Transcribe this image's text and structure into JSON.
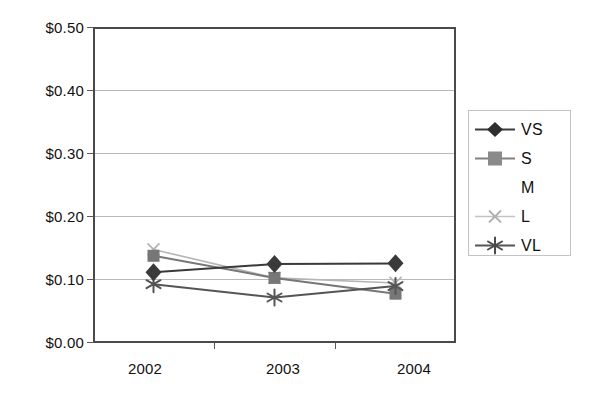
{
  "chart_data": {
    "type": "line",
    "title": "",
    "xlabel": "",
    "ylabel": "",
    "categories": [
      "2002",
      "2003",
      "2004"
    ],
    "ylim": [
      0.0,
      0.5
    ],
    "ytick_values": [
      0.5,
      0.4,
      0.3,
      0.2,
      0.1,
      0.0
    ],
    "ytick_labels": [
      "$0.50",
      "$0.40",
      "$0.30",
      "$0.20",
      "$0.10",
      "$0.00"
    ],
    "grid": true,
    "legend_position": "right",
    "series": [
      {
        "name": "VS",
        "marker": "diamond",
        "color": "#3a3a3a",
        "values": [
          0.112,
          0.125,
          0.126
        ]
      },
      {
        "name": "S",
        "marker": "square",
        "color": "#777777",
        "values": [
          0.138,
          0.103,
          0.078
        ]
      },
      {
        "name": "M",
        "marker": "none",
        "color": "#ffffff",
        "values": [
          null,
          null,
          null
        ]
      },
      {
        "name": "L",
        "marker": "x",
        "color": "#b5b5b5",
        "values": [
          0.148,
          0.103,
          0.095
        ]
      },
      {
        "name": "VL",
        "marker": "asterisk",
        "color": "#555555",
        "values": [
          0.093,
          0.072,
          0.09
        ]
      }
    ]
  },
  "legend": {
    "entries": [
      {
        "label": "VS"
      },
      {
        "label": "S"
      },
      {
        "label": "M"
      },
      {
        "label": "L"
      },
      {
        "label": "VL"
      }
    ]
  }
}
